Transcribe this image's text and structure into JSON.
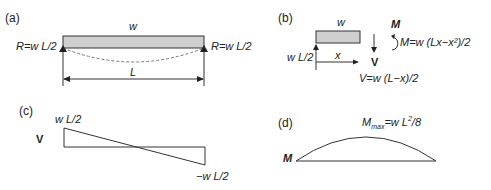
{
  "panels": {
    "a": {
      "tag": "(a)",
      "load_label": "w",
      "left_reaction": "R=w L/2",
      "right_reaction": "R=w L/2",
      "span_label": "L"
    },
    "b": {
      "tag": "(b)",
      "load_label": "w",
      "reaction_label": "w L/2",
      "x_label": "x",
      "moment_label": "M",
      "moment_eq": "M=w (Lx−x²)/2",
      "shear_label": "V",
      "shear_eq": "V=w (L−x)/2"
    },
    "c": {
      "tag": "(c)",
      "axis_label": "V",
      "max_label": "w L/2",
      "min_label": "−w L/2"
    },
    "d": {
      "tag": "(d)",
      "axis_label": "M",
      "max_label_main": "M",
      "max_label_sub": "max",
      "max_label_rest": "=w L",
      "max_label_sup": "2",
      "max_label_end": "/8"
    }
  },
  "colors": {
    "line": "#333333",
    "beam_fill": "#cfcfcf",
    "deflection": "#777777"
  }
}
